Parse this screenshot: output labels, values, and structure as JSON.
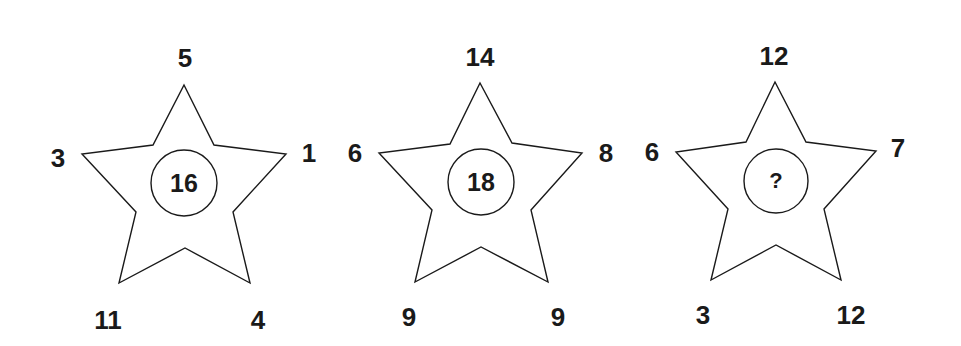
{
  "puzzle": {
    "stars": [
      {
        "points": {
          "top": "5",
          "left": "3",
          "right": "1",
          "bottom_left": "11",
          "bottom_right": "4"
        },
        "center": "16"
      },
      {
        "points": {
          "top": "14",
          "left": "6",
          "right": "8",
          "bottom_left": "9",
          "bottom_right": "9"
        },
        "center": "18"
      },
      {
        "points": {
          "top": "12",
          "left": "6",
          "right": "7",
          "bottom_left": "3",
          "bottom_right": "12"
        },
        "center": "?"
      }
    ],
    "colors": {
      "line": "#1a1a1a",
      "background": "#ffffff"
    }
  }
}
